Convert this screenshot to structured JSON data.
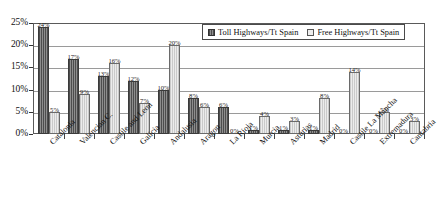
{
  "chart_data": {
    "type": "bar",
    "title": "",
    "subtitle": "",
    "xlabel": "",
    "ylabel": "",
    "ylim": [
      0,
      25
    ],
    "ytick_labels": [
      "0%",
      "5%",
      "10%",
      "15%",
      "20%",
      "25%"
    ],
    "ytick_values": [
      0,
      5,
      10,
      15,
      20,
      25
    ],
    "grid": true,
    "legend_position": "top-right",
    "categories": [
      "Catalonia",
      "Valencian C.",
      "Castile and Leon",
      "Galicia",
      "Andalusia",
      "Aragon",
      "La Rioja",
      "Murcia",
      "Asturias",
      "Madrid",
      "Castile La Mancha",
      "Extremadura",
      "Cantabria"
    ],
    "series": [
      {
        "name": "Toll Highways/Tt Spain",
        "color": "#6e6e6e",
        "values": [
          24,
          17,
          13,
          12,
          10,
          8,
          6,
          1,
          1,
          1,
          0,
          0,
          0
        ],
        "labels": [
          "24%",
          "17%",
          "13%",
          "12%",
          "10%",
          "8%",
          "6%",
          "1%",
          "1%",
          "1%",
          "0%",
          "0%",
          "0%"
        ]
      },
      {
        "name": "Free Highways/Tt Spain",
        "color": "#d9d9d9",
        "values": [
          5,
          9,
          16,
          7,
          20,
          6,
          0,
          4,
          3,
          8,
          14,
          5,
          3
        ],
        "labels": [
          "5%",
          "9%",
          "16%",
          "7%",
          "20%",
          "6%",
          "0%",
          "4%",
          "3%",
          "8%",
          "14%",
          "5%",
          "3%"
        ]
      }
    ]
  },
  "legend": {
    "items": [
      {
        "label": "Toll Highways/Tt Spain"
      },
      {
        "label": "Free Highways/Tt Spain"
      }
    ]
  }
}
